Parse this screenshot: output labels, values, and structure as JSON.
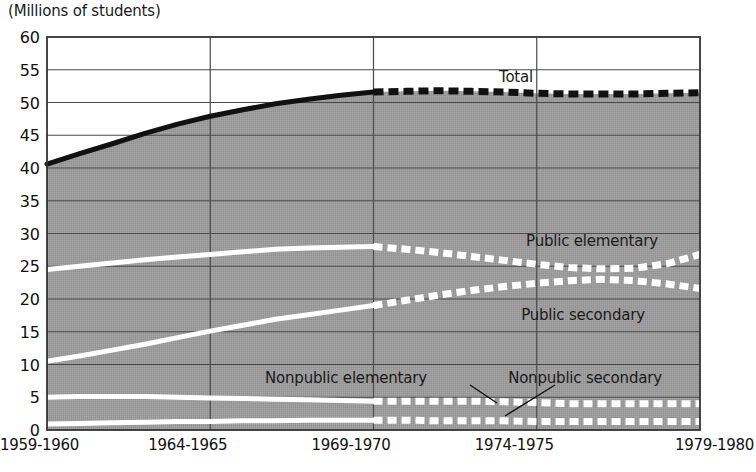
{
  "figure": {
    "unit_label": "(Millions of students)",
    "background_color": "#ffffff",
    "plot_fill_color": "#9a9a9a",
    "gridline_color": "#4a4a4a",
    "frame_color": "#333333",
    "solid_curve_color": "#ffffff",
    "total_curve_color": "#111111"
  },
  "chart_data": {
    "type": "line",
    "title": "",
    "subtitle": "",
    "xlabel": "",
    "ylabel": "(Millions of students)",
    "ylim": [
      0,
      60
    ],
    "ytick_step": 5,
    "yticks": [
      60,
      55,
      50,
      45,
      40,
      35,
      30,
      25,
      20,
      15,
      10,
      5,
      0
    ],
    "xticks": [
      "1959-1960",
      "1964-1965",
      "1969-1970",
      "1974-1975",
      "1979-1980"
    ],
    "x_start_year": 1959,
    "x_end_year": 1979,
    "grid": true,
    "legend": "inline-annotations",
    "projection_note": "Values from 1969-1970 onward are drawn as dashed (projected) lines.",
    "actual_projected_split_x": "1969-1970",
    "series": [
      {
        "name": "Total",
        "style_actual": "solid-black",
        "style_projected": "dashed-black",
        "x": [
          1959,
          1960,
          1961,
          1962,
          1963,
          1964,
          1965,
          1966,
          1967,
          1968,
          1969,
          1970,
          1971,
          1972,
          1973,
          1974,
          1975,
          1976,
          1977,
          1978,
          1979
        ],
        "values": [
          40.6,
          42.2,
          43.7,
          45.3,
          46.7,
          47.9,
          48.9,
          49.8,
          50.5,
          51.1,
          51.6,
          51.7,
          51.8,
          51.7,
          51.6,
          51.4,
          51.3,
          51.3,
          51.3,
          51.4,
          51.5
        ]
      },
      {
        "name": "Public elementary",
        "style_actual": "solid-white",
        "style_projected": "dashed-white",
        "x": [
          1959,
          1960,
          1961,
          1962,
          1963,
          1964,
          1965,
          1966,
          1967,
          1968,
          1969,
          1970,
          1971,
          1972,
          1973,
          1974,
          1975,
          1976,
          1977,
          1978,
          1979
        ],
        "values": [
          24.5,
          25.0,
          25.5,
          26.0,
          26.4,
          26.8,
          27.2,
          27.6,
          27.8,
          27.9,
          28.0,
          27.6,
          27.1,
          26.5,
          25.9,
          25.3,
          24.8,
          24.6,
          24.7,
          25.4,
          26.8
        ]
      },
      {
        "name": "Public secondary",
        "style_actual": "solid-white",
        "style_projected": "dashed-white",
        "x": [
          1959,
          1960,
          1961,
          1962,
          1963,
          1964,
          1965,
          1966,
          1967,
          1968,
          1969,
          1970,
          1971,
          1972,
          1973,
          1974,
          1975,
          1976,
          1977,
          1978,
          1979
        ],
        "values": [
          10.5,
          11.3,
          12.2,
          13.1,
          14.1,
          15.1,
          16.0,
          16.9,
          17.6,
          18.3,
          19.0,
          19.8,
          20.6,
          21.3,
          21.9,
          22.4,
          22.8,
          23.0,
          22.8,
          22.3,
          21.6
        ]
      },
      {
        "name": "Nonpublic elementary",
        "style_actual": "solid-white",
        "style_projected": "dashed-white",
        "x": [
          1959,
          1960,
          1961,
          1962,
          1963,
          1964,
          1965,
          1966,
          1967,
          1968,
          1969,
          1970,
          1971,
          1972,
          1973,
          1974,
          1975,
          1976,
          1977,
          1978,
          1979
        ],
        "values": [
          5.0,
          5.1,
          5.1,
          5.1,
          5.0,
          4.9,
          4.8,
          4.7,
          4.6,
          4.5,
          4.4,
          4.4,
          4.4,
          4.4,
          4.3,
          4.2,
          4.0,
          4.0,
          4.0,
          4.0,
          4.0
        ]
      },
      {
        "name": "Nonpublic secondary",
        "style_actual": "solid-white",
        "style_projected": "dashed-white",
        "x": [
          1959,
          1960,
          1961,
          1962,
          1963,
          1964,
          1965,
          1966,
          1967,
          1968,
          1969,
          1970,
          1971,
          1972,
          1973,
          1974,
          1975,
          1976,
          1977,
          1978,
          1979
        ],
        "values": [
          0.9,
          1.0,
          1.1,
          1.2,
          1.3,
          1.3,
          1.4,
          1.4,
          1.5,
          1.5,
          1.5,
          1.5,
          1.4,
          1.4,
          1.4,
          1.3,
          1.3,
          1.3,
          1.3,
          1.3,
          1.3
        ]
      }
    ],
    "annotations": [
      {
        "text": "Total",
        "x_px": 516,
        "y_px": 77
      },
      {
        "text": "Public elementary",
        "x_px": 592,
        "y_px": 241
      },
      {
        "text": "Public secondary",
        "x_px": 583,
        "y_px": 315
      },
      {
        "text": "Nonpublic elementary",
        "x_px": 346,
        "y_px": 378
      },
      {
        "text": "Nonpublic secondary",
        "x_px": 585,
        "y_px": 378
      }
    ]
  }
}
